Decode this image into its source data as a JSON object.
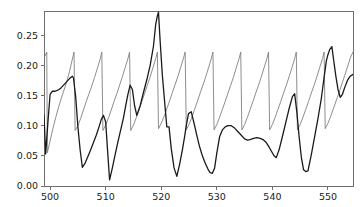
{
  "chart_data": {
    "type": "line",
    "title": "",
    "xlabel": "",
    "ylabel": "",
    "xlim": [
      498.9,
      554.5
    ],
    "ylim": [
      0.0,
      0.29
    ],
    "grid": false,
    "legend": null,
    "xticks": [
      500,
      510,
      520,
      530,
      540,
      550
    ],
    "xtick_labels": [
      "500",
      "510",
      "520",
      "530",
      "540",
      "550"
    ],
    "yticks": [
      0.0,
      0.05,
      0.1,
      0.15,
      0.2,
      0.25
    ],
    "ytick_labels": [
      "0.00",
      "0.05",
      "0.10",
      "0.15",
      "0.20",
      "0.25"
    ],
    "series": [
      {
        "name": "sawtooth-series",
        "color": "#808080",
        "width": 0.9,
        "x": [
          498.9,
          499.4,
          499.5,
          500.0,
          500.5,
          501.0,
          501.5,
          502.0,
          502.5,
          503.0,
          503.5,
          504.0,
          504.3,
          504.5,
          505.0,
          505.5,
          506.0,
          506.5,
          507.0,
          507.5,
          508.0,
          508.5,
          509.0,
          509.3,
          509.5,
          510.0,
          510.5,
          511.0,
          511.5,
          512.0,
          512.5,
          513.0,
          513.5,
          514.0,
          514.3,
          514.5,
          515.0,
          515.5,
          516.0,
          516.5,
          517.0,
          517.5,
          518.0,
          518.5,
          519.0,
          519.3,
          519.5,
          520.0,
          520.5,
          521.0,
          521.5,
          522.0,
          522.5,
          523.0,
          523.5,
          524.0,
          524.3,
          524.5,
          525.0,
          525.5,
          526.0,
          526.5,
          527.0,
          527.5,
          528.0,
          528.5,
          529.0,
          529.3,
          529.5,
          530.0,
          530.5,
          531.0,
          531.5,
          532.0,
          532.5,
          533.0,
          533.5,
          534.0,
          534.3,
          534.5,
          535.0,
          535.5,
          536.0,
          536.5,
          537.0,
          537.5,
          538.0,
          538.5,
          539.0,
          539.3,
          539.5,
          540.0,
          540.5,
          541.0,
          541.5,
          542.0,
          542.5,
          543.0,
          543.5,
          544.0,
          544.3,
          544.5,
          545.0,
          545.5,
          546.0,
          546.5,
          547.0,
          547.5,
          548.0,
          548.5,
          549.0,
          549.3,
          549.5,
          550.0,
          550.5,
          551.0,
          551.5,
          552.0,
          552.5,
          553.0,
          553.5,
          554.0,
          554.5
        ],
        "y": [
          0.212,
          0.222,
          0.055,
          0.075,
          0.095,
          0.113,
          0.13,
          0.145,
          0.159,
          0.173,
          0.19,
          0.21,
          0.222,
          0.092,
          0.1,
          0.112,
          0.126,
          0.14,
          0.153,
          0.166,
          0.18,
          0.195,
          0.21,
          0.222,
          0.092,
          0.101,
          0.113,
          0.126,
          0.14,
          0.153,
          0.167,
          0.181,
          0.196,
          0.211,
          0.222,
          0.092,
          0.101,
          0.113,
          0.126,
          0.14,
          0.153,
          0.167,
          0.181,
          0.196,
          0.211,
          0.222,
          0.095,
          0.104,
          0.115,
          0.128,
          0.141,
          0.155,
          0.168,
          0.182,
          0.197,
          0.212,
          0.222,
          0.093,
          0.102,
          0.114,
          0.127,
          0.14,
          0.154,
          0.167,
          0.181,
          0.196,
          0.211,
          0.222,
          0.093,
          0.102,
          0.114,
          0.127,
          0.14,
          0.154,
          0.167,
          0.181,
          0.196,
          0.211,
          0.222,
          0.093,
          0.102,
          0.114,
          0.127,
          0.14,
          0.154,
          0.167,
          0.181,
          0.196,
          0.211,
          0.222,
          0.093,
          0.102,
          0.114,
          0.127,
          0.14,
          0.154,
          0.167,
          0.181,
          0.196,
          0.211,
          0.222,
          0.093,
          0.102,
          0.114,
          0.127,
          0.14,
          0.154,
          0.167,
          0.181,
          0.196,
          0.211,
          0.222,
          0.095,
          0.104,
          0.116,
          0.129,
          0.142,
          0.155,
          0.169,
          0.183,
          0.197,
          0.212,
          0.222
        ]
      },
      {
        "name": "signal-series",
        "color": "#1a1a1a",
        "width": 1.3,
        "x": [
          498.9,
          499.2,
          499.6,
          500.0,
          500.4,
          500.8,
          501.2,
          501.6,
          502.0,
          502.5,
          503.0,
          503.5,
          504.0,
          504.2,
          504.6,
          505.0,
          505.4,
          505.8,
          506.3,
          506.8,
          507.3,
          507.8,
          508.3,
          508.8,
          509.2,
          509.6,
          510.0,
          510.3,
          510.7,
          511.2,
          511.7,
          512.2,
          512.7,
          513.2,
          513.6,
          514.0,
          514.4,
          514.8,
          515.2,
          515.6,
          516.2,
          516.8,
          517.4,
          518.0,
          518.6,
          519.0,
          519.3,
          519.5,
          519.8,
          520.2,
          520.6,
          521.0,
          521.4,
          521.8,
          522.3,
          522.8,
          523.3,
          523.8,
          524.2,
          524.5,
          524.9,
          525.4,
          525.9,
          526.4,
          526.9,
          527.4,
          527.9,
          528.4,
          528.8,
          529.2,
          529.6,
          530.0,
          530.5,
          531.0,
          531.5,
          532.0,
          532.6,
          533.2,
          533.8,
          534.4,
          535.0,
          535.5,
          536.0,
          536.6,
          537.2,
          537.8,
          538.3,
          538.8,
          539.3,
          539.8,
          540.3,
          540.7,
          541.2,
          541.8,
          542.4,
          543.0,
          543.6,
          544.0,
          544.4,
          544.8,
          545.2,
          545.6,
          546.0,
          546.4,
          547.0,
          547.6,
          548.2,
          548.8,
          549.3,
          549.7,
          550.0,
          550.3,
          550.7,
          551.0,
          551.4,
          551.8,
          552.2,
          552.6,
          553.0,
          553.5,
          554.0,
          554.5
        ],
        "y": [
          0.118,
          0.053,
          0.105,
          0.152,
          0.157,
          0.157,
          0.158,
          0.16,
          0.163,
          0.168,
          0.173,
          0.178,
          0.182,
          0.179,
          0.148,
          0.098,
          0.06,
          0.031,
          0.038,
          0.049,
          0.06,
          0.072,
          0.084,
          0.098,
          0.11,
          0.117,
          0.106,
          0.064,
          0.01,
          0.03,
          0.052,
          0.073,
          0.093,
          0.113,
          0.133,
          0.152,
          0.167,
          0.16,
          0.133,
          0.117,
          0.133,
          0.155,
          0.176,
          0.2,
          0.232,
          0.268,
          0.282,
          0.288,
          0.24,
          0.183,
          0.14,
          0.098,
          0.098,
          0.062,
          0.03,
          0.016,
          0.036,
          0.06,
          0.082,
          0.1,
          0.12,
          0.123,
          0.104,
          0.084,
          0.065,
          0.05,
          0.038,
          0.028,
          0.022,
          0.021,
          0.03,
          0.055,
          0.082,
          0.093,
          0.098,
          0.1,
          0.1,
          0.096,
          0.09,
          0.084,
          0.078,
          0.076,
          0.077,
          0.079,
          0.08,
          0.079,
          0.077,
          0.073,
          0.066,
          0.058,
          0.05,
          0.047,
          0.06,
          0.082,
          0.105,
          0.128,
          0.148,
          0.153,
          0.122,
          0.082,
          0.048,
          0.027,
          0.024,
          0.025,
          0.052,
          0.082,
          0.112,
          0.145,
          0.18,
          0.207,
          0.218,
          0.226,
          0.231,
          0.21,
          0.183,
          0.16,
          0.147,
          0.152,
          0.163,
          0.175,
          0.182,
          0.185
        ]
      }
    ]
  },
  "axes": {
    "spine_color": "#6e6e6e",
    "background": "#ffffff"
  }
}
